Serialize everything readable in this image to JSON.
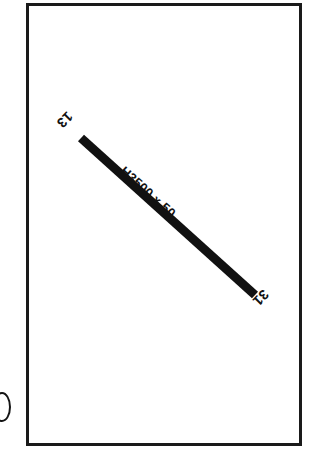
{
  "sheet": {
    "background_color": "#ffffff",
    "width": 317,
    "height": 458
  },
  "frame": {
    "name": "drawing-border",
    "stroke_color": "#1a1a1a",
    "stroke_width": 3,
    "fill_color": "#ffffff"
  },
  "beam": {
    "fill_color": "#111111",
    "thickness": 9,
    "angle_degrees": 42,
    "start_point": {
      "x": 81,
      "y": 138
    },
    "end_point": {
      "x": 255,
      "y": 295
    }
  },
  "labels": {
    "member_size": "H3500 x 50",
    "end_start": "13",
    "end_finish": "31"
  },
  "artifact": {
    "description": "clipped-glyph"
  }
}
